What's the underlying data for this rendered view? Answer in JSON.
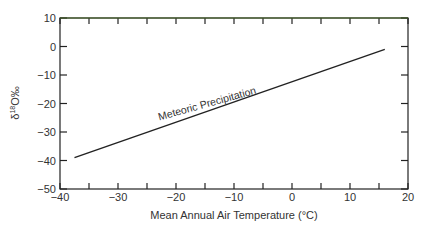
{
  "chart_data": {
    "type": "line",
    "title": "",
    "xlabel": "Mean Annual Air Temperature (°C)",
    "ylabel": "δ18O‰",
    "xlim": [
      -40,
      20
    ],
    "ylim": [
      -50,
      10
    ],
    "x_ticks": [
      "-40",
      "-30",
      "-20",
      "-10",
      "0",
      "10",
      "20"
    ],
    "y_ticks": [
      "10",
      "0",
      "-10",
      "-20",
      "-30",
      "-40",
      "-50"
    ],
    "grid": false,
    "legend": null,
    "series": [
      {
        "name": "Meteoric Precipitation",
        "x": [
          -37.5,
          16
        ],
        "y": [
          -39,
          -1
        ]
      }
    ],
    "annotations": [
      {
        "text": "Meteoric Precipitation",
        "x": -12,
        "y": -22
      }
    ]
  }
}
